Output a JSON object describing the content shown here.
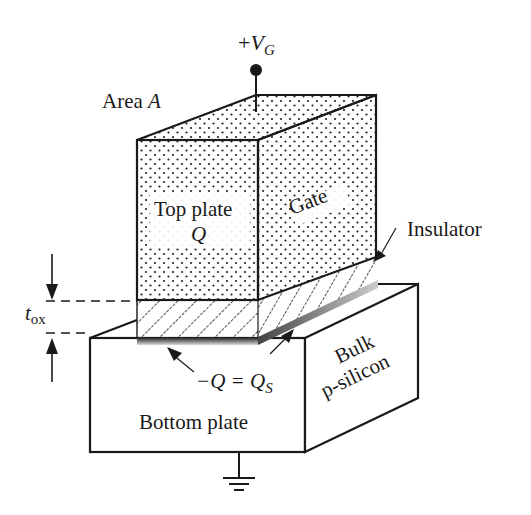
{
  "diagram": {
    "labels": {
      "gate_voltage": {
        "sign": "+",
        "symbol": "V",
        "subscript": "G"
      },
      "area": {
        "text": "Area ",
        "symbol": "A"
      },
      "top_plate": "Top plate",
      "top_plate_charge": "Q",
      "gate": "Gate",
      "insulator": "Insulator",
      "oxide_thickness": {
        "symbol": "t",
        "subscript": "ox"
      },
      "substrate_charge": {
        "lhs": "−Q = Q",
        "subscript": "S"
      },
      "bulk_line1": "Bulk",
      "bulk_line2": "p-silicon",
      "bottom_plate": "Bottom plate"
    },
    "components": [
      {
        "id": "gate",
        "fill": "dotted"
      },
      {
        "id": "insulator",
        "fill": "hatched"
      },
      {
        "id": "bulk",
        "fill": "white"
      },
      {
        "id": "ground",
        "type": "ground-symbol"
      },
      {
        "id": "gate-terminal",
        "type": "terminal-dot"
      }
    ],
    "colors": {
      "stroke": "#1a1a1a",
      "background": "#ffffff",
      "dot": "#222222",
      "hatch": "#222222"
    }
  }
}
